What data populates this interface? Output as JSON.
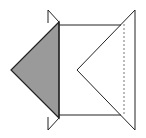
{
  "figure": {
    "colors": {
      "background": "#ffffff",
      "stroke": "#222222",
      "shaded_fill": "#9a9a9a",
      "dashed": "#555555"
    },
    "shapes": {
      "square": {
        "x1": 59,
        "y1": 25,
        "x2": 121,
        "y2": 115
      },
      "shaded_triangle": [
        [
          59,
          22
        ],
        [
          11,
          70
        ],
        [
          59,
          118
        ]
      ],
      "top_small_triangle": [
        [
          48,
          10
        ],
        [
          59,
          22
        ],
        [
          48,
          23
        ]
      ],
      "bottom_small_triangle": [
        [
          48,
          117
        ],
        [
          59,
          118
        ],
        [
          48,
          130
        ]
      ],
      "right_triangle": [
        [
          135,
          10
        ],
        [
          77,
          70
        ],
        [
          135,
          130
        ]
      ],
      "dashed_line": {
        "x": 124,
        "y1": 24,
        "y2": 116
      }
    }
  }
}
